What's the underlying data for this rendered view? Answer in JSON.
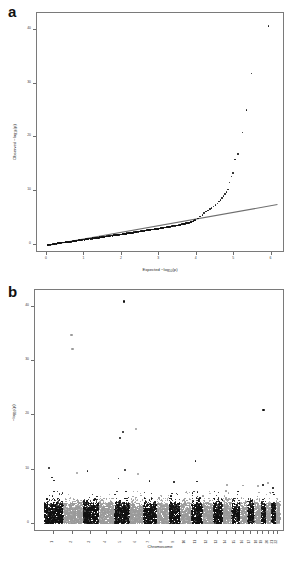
{
  "figure": {
    "panels": [
      {
        "letter": "a",
        "type": "qq"
      },
      {
        "letter": "b",
        "type": "manhattan"
      }
    ]
  },
  "panel_a": {
    "letter": "a",
    "annotation": "lambda = 0.92",
    "lambda_value": "0.92",
    "xlabel_prefix": "Expected  −log",
    "xlabel_sub": "10",
    "xlabel_suffix": "(p)",
    "ylabel_prefix": "Observed  −log",
    "ylabel_sub": "10",
    "ylabel_suffix": "(p)",
    "xticks": [
      "0",
      "1",
      "2",
      "3",
      "4",
      "5",
      "6"
    ],
    "yticks": [
      "0",
      "10",
      "20",
      "30",
      "40"
    ]
  },
  "panel_b": {
    "letter": "b",
    "xlabel": "Chromosome",
    "ylabel_prefix": "−log",
    "ylabel_sub": "10",
    "ylabel_suffix": "(p)",
    "yticks": [
      "0",
      "10",
      "20",
      "30",
      "40"
    ],
    "chromosomes": [
      "1",
      "2",
      "3",
      "4",
      "5",
      "6",
      "7",
      "8",
      "9",
      "10",
      "11",
      "12",
      "13",
      "14",
      "15",
      "16",
      "17",
      "18",
      "19",
      "20",
      "21",
      "22"
    ]
  },
  "colors": {
    "band_dark": "#111111",
    "band_light": "#9a9a9a",
    "axis": "#7a7a7a",
    "text": "#1a1a1a",
    "background": "#ffffff"
  },
  "chart_data": [
    {
      "type": "scatter",
      "title": "a",
      "subtitle": "QQ plot of GWAS p-values",
      "xlabel": "Expected −log10(p)",
      "ylabel": "Observed −log10(p)",
      "xlim": [
        0,
        6.2
      ],
      "ylim": [
        0,
        42
      ],
      "xticks": [
        0,
        1,
        2,
        3,
        4,
        5,
        6
      ],
      "yticks": [
        0,
        10,
        20,
        30,
        40
      ],
      "grid": false,
      "legend": null,
      "annotations": [
        {
          "text": "lambda = 0.92",
          "x": 0.45,
          "y": 39.0
        }
      ],
      "reference_line": {
        "type": "identity-ish",
        "x0": 0.0,
        "y0": 0.0,
        "x1": 6.15,
        "y1": 7.6
      },
      "points": [
        {
          "x": 0.02,
          "y": 0.02
        },
        {
          "x": 0.05,
          "y": 0.05
        },
        {
          "x": 0.09,
          "y": 0.09
        },
        {
          "x": 0.13,
          "y": 0.14
        },
        {
          "x": 0.18,
          "y": 0.18
        },
        {
          "x": 0.23,
          "y": 0.23
        },
        {
          "x": 0.28,
          "y": 0.29
        },
        {
          "x": 0.33,
          "y": 0.34
        },
        {
          "x": 0.39,
          "y": 0.4
        },
        {
          "x": 0.45,
          "y": 0.46
        },
        {
          "x": 0.51,
          "y": 0.52
        },
        {
          "x": 0.57,
          "y": 0.58
        },
        {
          "x": 0.63,
          "y": 0.64
        },
        {
          "x": 0.7,
          "y": 0.71
        },
        {
          "x": 0.77,
          "y": 0.78
        },
        {
          "x": 0.84,
          "y": 0.85
        },
        {
          "x": 0.91,
          "y": 0.92
        },
        {
          "x": 0.98,
          "y": 0.99
        },
        {
          "x": 1.06,
          "y": 1.07
        },
        {
          "x": 1.14,
          "y": 1.15
        },
        {
          "x": 1.22,
          "y": 1.23
        },
        {
          "x": 1.3,
          "y": 1.31
        },
        {
          "x": 1.39,
          "y": 1.4
        },
        {
          "x": 1.48,
          "y": 1.49
        },
        {
          "x": 1.57,
          "y": 1.58
        },
        {
          "x": 1.66,
          "y": 1.67
        },
        {
          "x": 1.76,
          "y": 1.77
        },
        {
          "x": 1.86,
          "y": 1.87
        },
        {
          "x": 1.96,
          "y": 1.98
        },
        {
          "x": 2.06,
          "y": 2.08
        },
        {
          "x": 2.16,
          "y": 2.19
        },
        {
          "x": 2.27,
          "y": 2.3
        },
        {
          "x": 2.38,
          "y": 2.41
        },
        {
          "x": 2.49,
          "y": 2.53
        },
        {
          "x": 2.6,
          "y": 2.65
        },
        {
          "x": 2.72,
          "y": 2.77
        },
        {
          "x": 2.84,
          "y": 2.9
        },
        {
          "x": 2.96,
          "y": 3.03
        },
        {
          "x": 3.08,
          "y": 3.16
        },
        {
          "x": 3.2,
          "y": 3.3
        },
        {
          "x": 3.32,
          "y": 3.45
        },
        {
          "x": 3.44,
          "y": 3.6
        },
        {
          "x": 3.56,
          "y": 3.76
        },
        {
          "x": 3.67,
          "y": 3.93
        },
        {
          "x": 3.78,
          "y": 4.12
        },
        {
          "x": 3.88,
          "y": 4.34
        },
        {
          "x": 3.96,
          "y": 4.6
        },
        {
          "x": 4.03,
          "y": 4.95
        },
        {
          "x": 4.09,
          "y": 5.3
        },
        {
          "x": 4.15,
          "y": 5.62
        },
        {
          "x": 4.2,
          "y": 5.92
        },
        {
          "x": 4.25,
          "y": 6.18
        },
        {
          "x": 4.3,
          "y": 6.42
        },
        {
          "x": 4.35,
          "y": 6.65
        },
        {
          "x": 4.4,
          "y": 6.9
        },
        {
          "x": 4.45,
          "y": 7.15
        },
        {
          "x": 4.5,
          "y": 7.42
        },
        {
          "x": 4.55,
          "y": 7.7
        },
        {
          "x": 4.6,
          "y": 8.05
        },
        {
          "x": 4.64,
          "y": 8.4
        },
        {
          "x": 4.68,
          "y": 8.75
        },
        {
          "x": 4.72,
          "y": 9.1
        },
        {
          "x": 4.76,
          "y": 9.45
        },
        {
          "x": 4.8,
          "y": 9.85
        },
        {
          "x": 4.84,
          "y": 10.3
        },
        {
          "x": 4.88,
          "y": 11.6
        },
        {
          "x": 4.93,
          "y": 12.7
        },
        {
          "x": 4.97,
          "y": 13.4
        },
        {
          "x": 5.02,
          "y": 15.9
        },
        {
          "x": 5.1,
          "y": 16.9
        },
        {
          "x": 5.22,
          "y": 20.9
        },
        {
          "x": 5.33,
          "y": 25.1
        },
        {
          "x": 5.47,
          "y": 31.9
        },
        {
          "x": 5.92,
          "y": 40.7
        }
      ]
    },
    {
      "type": "scatter",
      "title": "b",
      "subtitle": "Manhattan plot of GWAS p-values by chromosome",
      "xlabel": "Chromosome",
      "ylabel": "−log10(p)",
      "xlim": [
        0,
        22
      ],
      "ylim": [
        0,
        42
      ],
      "yticks": [
        0,
        10,
        20,
        30,
        40
      ],
      "xtick_labels": [
        "1",
        "2",
        "3",
        "4",
        "5",
        "6",
        "7",
        "8",
        "9",
        "10",
        "11",
        "12",
        "13",
        "14",
        "15",
        "16",
        "17",
        "18",
        "19",
        "20",
        "21",
        "22"
      ],
      "grid": false,
      "legend": null,
      "band_colors": [
        "#111111",
        "#9a9a9a"
      ],
      "chromosome_widths": [
        9.0,
        8.8,
        7.3,
        7.0,
        6.7,
        6.3,
        5.9,
        5.4,
        5.1,
        4.9,
        4.9,
        4.8,
        4.1,
        3.9,
        3.6,
        3.2,
        2.9,
        2.8,
        2.1,
        2.3,
        1.7,
        1.8
      ],
      "notable_peaks": [
        {
          "chromosome": 5,
          "value": 41.0
        },
        {
          "chromosome": 2,
          "value": 34.8
        },
        {
          "chromosome": 2,
          "value": 32.2
        },
        {
          "chromosome": 19,
          "value": 21.0
        },
        {
          "chromosome": 6,
          "value": 17.5
        },
        {
          "chromosome": 5,
          "value": 16.9
        },
        {
          "chromosome": 5,
          "value": 15.9
        },
        {
          "chromosome": 11,
          "value": 11.6
        },
        {
          "chromosome": 1,
          "value": 10.3
        },
        {
          "chromosome": 5,
          "value": 9.9
        },
        {
          "chromosome": 3,
          "value": 9.7
        },
        {
          "chromosome": 2,
          "value": 9.4
        },
        {
          "chromosome": 6,
          "value": 9.2
        },
        {
          "chromosome": 1,
          "value": 8.6
        },
        {
          "chromosome": 5,
          "value": 8.4
        },
        {
          "chromosome": 1,
          "value": 8.0
        },
        {
          "chromosome": 7,
          "value": 7.9
        },
        {
          "chromosome": 9,
          "value": 7.7
        },
        {
          "chromosome": 11,
          "value": 7.8
        },
        {
          "chromosome": 20,
          "value": 7.6
        },
        {
          "chromosome": 14,
          "value": 7.2
        },
        {
          "chromosome": 16,
          "value": 7.1
        },
        {
          "chromosome": 18,
          "value": 7.0
        },
        {
          "chromosome": 19,
          "value": 7.2
        },
        {
          "chromosome": 21,
          "value": 6.6
        }
      ],
      "baseline_noise_max": 5.2
    }
  ]
}
